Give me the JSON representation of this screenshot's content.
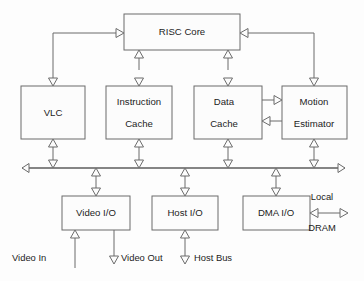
{
  "diagram": {
    "type": "block-diagram",
    "colors": {
      "background": "#fdfdfd",
      "block_fill": "#fcfcfc",
      "line": "#6b6b6b",
      "text": "#1c1c1c"
    },
    "blocks": [
      {
        "id": "risc_core",
        "label": "RISC Core",
        "label2": "",
        "x": 124,
        "y": 14,
        "w": 116,
        "h": 36
      },
      {
        "id": "vlc",
        "label": "VLC",
        "label2": "",
        "x": 21,
        "y": 86,
        "w": 64,
        "h": 53
      },
      {
        "id": "instruction_cache",
        "label": "Instruction",
        "label2": "Cache",
        "x": 106,
        "y": 86,
        "w": 66,
        "h": 53
      },
      {
        "id": "data_cache",
        "label": "Data",
        "label2": "Cache",
        "x": 194,
        "y": 86,
        "w": 68,
        "h": 53
      },
      {
        "id": "motion_estimator",
        "label": "Motion",
        "label2": "Estimator",
        "x": 282,
        "y": 86,
        "w": 65,
        "h": 53
      },
      {
        "id": "video_io",
        "label": "Video I/O",
        "label2": "",
        "x": 62,
        "y": 196,
        "w": 68,
        "h": 34
      },
      {
        "id": "host_io",
        "label": "Host I/O",
        "label2": "",
        "x": 152,
        "y": 196,
        "w": 66,
        "h": 34
      },
      {
        "id": "dma_io",
        "label": "DMA  I/O",
        "label2": "",
        "x": 243,
        "y": 196,
        "w": 67,
        "h": 34
      }
    ],
    "bus": {
      "label": "system-bus",
      "y": 168,
      "x_start": 22,
      "x_end": 345
    },
    "external_labels": [
      {
        "id": "video_in",
        "text": "Video In",
        "x": 32,
        "y": 259
      },
      {
        "id": "video_out",
        "text": "Video Out",
        "x": 124,
        "y": 259
      },
      {
        "id": "host_bus",
        "text": "Host Bus",
        "x": 200,
        "y": 259
      },
      {
        "id": "local",
        "text": "Local",
        "x": 318,
        "y": 198
      },
      {
        "id": "dram",
        "text": "DRAM",
        "x": 318,
        "y": 229
      }
    ],
    "connections": [
      {
        "from": "risc_core",
        "to": "vlc",
        "kind": "elbow-left",
        "direction": "one-way"
      },
      {
        "from": "risc_core",
        "to": "instruction_cache",
        "kind": "vertical",
        "direction": "bidirectional"
      },
      {
        "from": "risc_core",
        "to": "data_cache",
        "kind": "vertical",
        "direction": "bidirectional"
      },
      {
        "from": "risc_core",
        "to": "motion_estimator",
        "kind": "elbow-right",
        "direction": "one-way"
      },
      {
        "from": "data_cache",
        "to": "motion_estimator",
        "kind": "horizontal",
        "direction": "one-way"
      },
      {
        "from": "motion_estimator",
        "to": "data_cache",
        "kind": "horizontal",
        "direction": "one-way"
      },
      {
        "from": "vlc",
        "to": "bus",
        "kind": "vertical",
        "direction": "bidirectional"
      },
      {
        "from": "instruction_cache",
        "to": "bus",
        "kind": "vertical",
        "direction": "bidirectional"
      },
      {
        "from": "data_cache",
        "to": "bus",
        "kind": "vertical",
        "direction": "bidirectional"
      },
      {
        "from": "motion_estimator",
        "to": "bus",
        "kind": "vertical",
        "direction": "bidirectional"
      },
      {
        "from": "bus",
        "to": "video_io",
        "kind": "vertical",
        "direction": "bidirectional"
      },
      {
        "from": "bus",
        "to": "host_io",
        "kind": "vertical",
        "direction": "bidirectional"
      },
      {
        "from": "bus",
        "to": "dma_io",
        "kind": "vertical",
        "direction": "bidirectional"
      },
      {
        "from": "video_in",
        "to": "video_io",
        "kind": "vertical",
        "direction": "one-way"
      },
      {
        "from": "video_io",
        "to": "video_out",
        "kind": "vertical",
        "direction": "one-way"
      },
      {
        "from": "host_bus",
        "to": "host_io",
        "kind": "vertical",
        "direction": "one-way"
      },
      {
        "from": "dma_io",
        "to": "dram",
        "kind": "horizontal",
        "direction": "bidirectional"
      }
    ]
  }
}
